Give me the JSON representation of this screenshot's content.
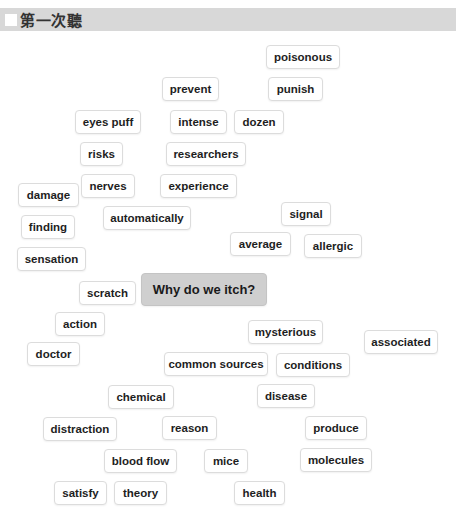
{
  "header": {
    "title": "第一次聽",
    "checkbox_checked": false
  },
  "center": {
    "label": "Why do we itch?",
    "x": 141,
    "y": 273,
    "w": 126
  },
  "words": [
    {
      "label": "poisonous",
      "x": 266,
      "y": 45,
      "w": 74
    },
    {
      "label": "prevent",
      "x": 162,
      "y": 77,
      "w": 57
    },
    {
      "label": "punish",
      "x": 268,
      "y": 77,
      "w": 55
    },
    {
      "label": "eyes puff",
      "x": 75,
      "y": 110,
      "w": 66
    },
    {
      "label": "intense",
      "x": 170,
      "y": 110,
      "w": 57
    },
    {
      "label": "dozen",
      "x": 234,
      "y": 110,
      "w": 50
    },
    {
      "label": "risks",
      "x": 80,
      "y": 142,
      "w": 43
    },
    {
      "label": "researchers",
      "x": 166,
      "y": 142,
      "w": 80
    },
    {
      "label": "nerves",
      "x": 81,
      "y": 174,
      "w": 54
    },
    {
      "label": "experience",
      "x": 160,
      "y": 174,
      "w": 77
    },
    {
      "label": "damage",
      "x": 18,
      "y": 183,
      "w": 61
    },
    {
      "label": "signal",
      "x": 281,
      "y": 202,
      "w": 50
    },
    {
      "label": "automatically",
      "x": 103,
      "y": 206,
      "w": 88
    },
    {
      "label": "finding",
      "x": 21,
      "y": 215,
      "w": 54
    },
    {
      "label": "average",
      "x": 230,
      "y": 232,
      "w": 61
    },
    {
      "label": "allergic",
      "x": 304,
      "y": 234,
      "w": 58
    },
    {
      "label": "sensation",
      "x": 17,
      "y": 247,
      "w": 69
    },
    {
      "label": "scratch",
      "x": 79,
      "y": 281,
      "w": 57
    },
    {
      "label": "action",
      "x": 55,
      "y": 312,
      "w": 50
    },
    {
      "label": "mysterious",
      "x": 248,
      "y": 320,
      "w": 75
    },
    {
      "label": "associated",
      "x": 364,
      "y": 330,
      "w": 74
    },
    {
      "label": "doctor",
      "x": 27,
      "y": 342,
      "w": 53
    },
    {
      "label": "common sources",
      "x": 164,
      "y": 352,
      "w": 104
    },
    {
      "label": "conditions",
      "x": 276,
      "y": 353,
      "w": 74
    },
    {
      "label": "chemical",
      "x": 108,
      "y": 385,
      "w": 66
    },
    {
      "label": "disease",
      "x": 257,
      "y": 384,
      "w": 58
    },
    {
      "label": "distraction",
      "x": 43,
      "y": 417,
      "w": 74
    },
    {
      "label": "reason",
      "x": 162,
      "y": 416,
      "w": 55
    },
    {
      "label": "produce",
      "x": 305,
      "y": 416,
      "w": 62
    },
    {
      "label": "blood flow",
      "x": 104,
      "y": 449,
      "w": 73
    },
    {
      "label": "mice",
      "x": 204,
      "y": 449,
      "w": 44
    },
    {
      "label": "molecules",
      "x": 300,
      "y": 448,
      "w": 72
    },
    {
      "label": "satisfy",
      "x": 54,
      "y": 481,
      "w": 53
    },
    {
      "label": "theory",
      "x": 114,
      "y": 481,
      "w": 53
    },
    {
      "label": "health",
      "x": 234,
      "y": 481,
      "w": 51
    }
  ],
  "colors": {
    "header_bg": "#d8d8d8",
    "center_chip_bg": "#cfcfcf",
    "chip_border": "#dcdcdc",
    "text": "#1e1e1e"
  }
}
